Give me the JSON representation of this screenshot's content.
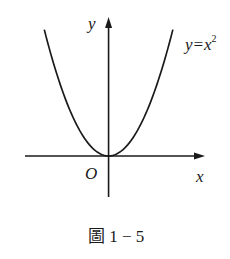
{
  "figure": {
    "caption": "圖 1 − 5",
    "curve_label": "y=x",
    "curve_exponent": "2",
    "x_axis_label": "x",
    "y_axis_label": "y",
    "origin_label": "O"
  },
  "chart_data": {
    "type": "line",
    "title": "",
    "function": "y = x^2",
    "xlabel": "x",
    "ylabel": "y",
    "series": [
      {
        "name": "y=x^2",
        "x": [
          -2,
          -1.5,
          -1,
          -0.5,
          0,
          0.5,
          1,
          1.5,
          2
        ],
        "y": [
          4,
          2.25,
          1,
          0.25,
          0,
          0.25,
          1,
          2.25,
          4
        ]
      }
    ],
    "xlim": [
      -2.6,
      3.0
    ],
    "ylim": [
      -1.3,
      4.4
    ],
    "grid": false,
    "ticks": "none",
    "colors": {
      "curve": "#1a1a1a",
      "axes": "#1a1a1a"
    }
  }
}
